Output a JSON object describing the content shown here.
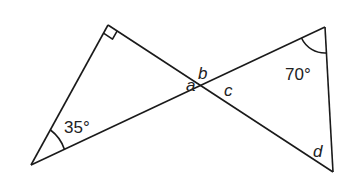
{
  "diagram": {
    "title": "",
    "colors": {
      "stroke": "#1a1a1a",
      "text": "#222222",
      "background": "#ffffff"
    },
    "points": {
      "right_angle_vertex": [
        108,
        25
      ],
      "bottom_left_vertex": [
        31,
        165
      ],
      "intersection": [
        202,
        86
      ],
      "top_right_vertex": [
        325,
        27
      ],
      "bottom_right_vertex": [
        333,
        172
      ]
    },
    "labels": {
      "angle_35": "35°",
      "angle_70": "70°",
      "a": "a",
      "b": "b",
      "c": "c",
      "d": "d"
    },
    "markers": {
      "right_angle": "right-angle square at top-left triangle apex",
      "arc_35": "angle arc at bottom-left vertex",
      "arc_70": "angle arc at top-right vertex"
    }
  }
}
